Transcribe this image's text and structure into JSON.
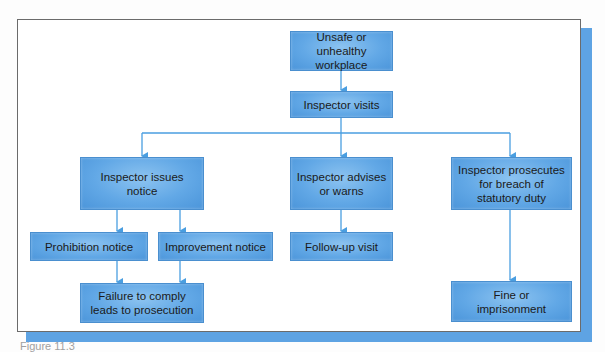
{
  "diagram": {
    "type": "flowchart",
    "nodes": {
      "start": "Unsafe or unhealthy\nworkplace",
      "visit": "Inspector visits",
      "issues_notice": "Inspector issues\nnotice",
      "advises": "Inspector advises\nor warns",
      "prosecutes": "Inspector prosecutes\nfor breach of\nstatutory duty",
      "prohibition": "Prohibition notice",
      "improvement": "Improvement notice",
      "followup": "Follow-up visit",
      "failure": "Failure to comply\nleads to prosecution",
      "fine": "Fine or\nimprisonment"
    },
    "edges": [
      [
        "start",
        "visit"
      ],
      [
        "visit",
        "issues_notice"
      ],
      [
        "visit",
        "advises"
      ],
      [
        "visit",
        "prosecutes"
      ],
      [
        "issues_notice",
        "prohibition"
      ],
      [
        "issues_notice",
        "improvement"
      ],
      [
        "advises",
        "followup"
      ],
      [
        "prohibition",
        "failure"
      ],
      [
        "improvement",
        "failure"
      ],
      [
        "prosecutes",
        "fine"
      ]
    ],
    "colors": {
      "box": "#62a8e6",
      "connector": "#4a9ee0",
      "shadow": "#5ea3e3",
      "frame_border": "#6b6b6b"
    }
  },
  "caption": "Figure 11.3"
}
